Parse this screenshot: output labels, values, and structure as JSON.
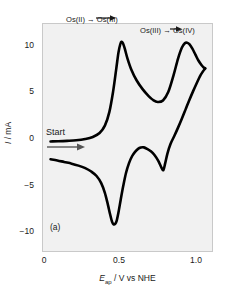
{
  "figure": {
    "panel_label": "(a)",
    "background_color": "#f1f1f1",
    "frame_color": "#c9c9c9",
    "curve_color": "#000000"
  },
  "annotations": {
    "start_label": "Start",
    "peak1_label": "Os(II) → Os(III)",
    "peak2_label": "Os(III) → Os(IV)"
  },
  "axes": {
    "xlabel_symbol": "E",
    "xlabel_subscript": "ap",
    "xlabel_rest": " / V vs NHE",
    "ylabel_symbol": "I",
    "ylabel_rest": " / mA",
    "xticks": [
      "0",
      "0.5",
      "1.0"
    ],
    "yticks": [
      "10",
      "5",
      "0",
      "−5",
      "−10"
    ]
  },
  "chart_data": {
    "type": "line",
    "title": "",
    "subtitle": "",
    "xlabel": "E_ap / V vs NHE",
    "ylabel": "I / mA",
    "xlim": [
      -0.02,
      1.1
    ],
    "ylim": [
      -11.0,
      12.0
    ],
    "xticks": [
      0,
      0.5,
      1.0
    ],
    "yticks": [
      10,
      5,
      0,
      -5,
      -10
    ],
    "grid": false,
    "legend": false,
    "legend_position": "none",
    "panel": "(a)",
    "annotations": [
      {
        "text": "Os(II) → Os(III)",
        "x": 0.52,
        "y": 12.6,
        "note": "first anodic wave assignment"
      },
      {
        "text": "Os(III) → Os(IV)",
        "x": 0.93,
        "y": 11.8,
        "note": "second anodic wave assignment"
      },
      {
        "text": "Start",
        "x": 0.06,
        "y": 1.9,
        "note": "scan start, arrow points right (positive sweep)"
      },
      {
        "text": "(a)",
        "x": 0.07,
        "y": -8.8,
        "note": "panel identifier"
      }
    ],
    "features": {
      "anodic_peak_1": {
        "potential_V": 0.5,
        "current_mA": 10.2,
        "assignment": "Os(II) -> Os(III)"
      },
      "anodic_trough": {
        "potential_V": 0.72,
        "current_mA": 4.0
      },
      "anodic_peak_2": {
        "potential_V": 0.93,
        "current_mA": 10.1,
        "assignment": "Os(III) -> Os(IV)"
      },
      "switching_potential_V": 1.05,
      "switching_current_mA": 7.5,
      "cathodic_peak_1": {
        "potential_V": 0.78,
        "current_mA": -2.8,
        "assignment": "Os(IV) -> Os(III)"
      },
      "cathodic_shoulder": {
        "potential_V": 0.64,
        "current_mA": -0.5
      },
      "cathodic_peak_2": {
        "potential_V": 0.46,
        "current_mA": -8.3,
        "assignment": "Os(III) -> Os(II)"
      },
      "return_current_mA": -1.7
    },
    "series": [
      {
        "name": "forward (anodic) scan",
        "x": [
          0.03,
          0.08,
          0.14,
          0.2,
          0.26,
          0.31,
          0.355,
          0.39,
          0.42,
          0.445,
          0.465,
          0.48,
          0.492,
          0.5,
          0.51,
          0.522,
          0.54,
          0.565,
          0.6,
          0.64,
          0.68,
          0.71,
          0.74,
          0.775,
          0.81,
          0.845,
          0.875,
          0.9,
          0.92,
          0.935,
          0.95,
          0.97,
          0.99,
          1.01,
          1.03,
          1.045,
          1.055
        ],
        "y": [
          0.1,
          0.12,
          0.16,
          0.22,
          0.35,
          0.55,
          0.95,
          1.7,
          3.1,
          5.2,
          7.4,
          9.1,
          9.95,
          10.2,
          10.05,
          9.5,
          8.5,
          7.4,
          6.3,
          5.4,
          4.7,
          4.3,
          4.1,
          4.25,
          5.1,
          6.8,
          8.5,
          9.6,
          10.05,
          10.1,
          9.95,
          9.5,
          8.9,
          8.3,
          7.85,
          7.6,
          7.5
        ]
      },
      {
        "name": "reverse (cathodic) scan",
        "x": [
          1.055,
          1.04,
          1.02,
          1.0,
          0.975,
          0.95,
          0.925,
          0.9,
          0.875,
          0.85,
          0.825,
          0.805,
          0.79,
          0.778,
          0.765,
          0.745,
          0.72,
          0.695,
          0.67,
          0.648,
          0.628,
          0.61,
          0.59,
          0.57,
          0.55,
          0.53,
          0.512,
          0.495,
          0.48,
          0.468,
          0.458,
          0.448,
          0.438,
          0.425,
          0.41,
          0.39,
          0.365,
          0.335,
          0.3,
          0.26,
          0.215,
          0.17,
          0.12,
          0.075,
          0.03
        ],
        "y": [
          7.5,
          7.2,
          6.7,
          6.05,
          5.2,
          4.3,
          3.35,
          2.4,
          1.5,
          0.65,
          -0.15,
          -1.1,
          -2.1,
          -2.8,
          -2.55,
          -1.9,
          -1.3,
          -0.9,
          -0.65,
          -0.5,
          -0.52,
          -0.65,
          -0.95,
          -1.4,
          -2.1,
          -3.1,
          -4.4,
          -5.8,
          -7.1,
          -7.95,
          -8.25,
          -8.3,
          -8.05,
          -7.3,
          -6.3,
          -5.1,
          -4.1,
          -3.4,
          -2.95,
          -2.6,
          -2.35,
          -2.15,
          -1.98,
          -1.82,
          -1.7
        ]
      }
    ]
  }
}
